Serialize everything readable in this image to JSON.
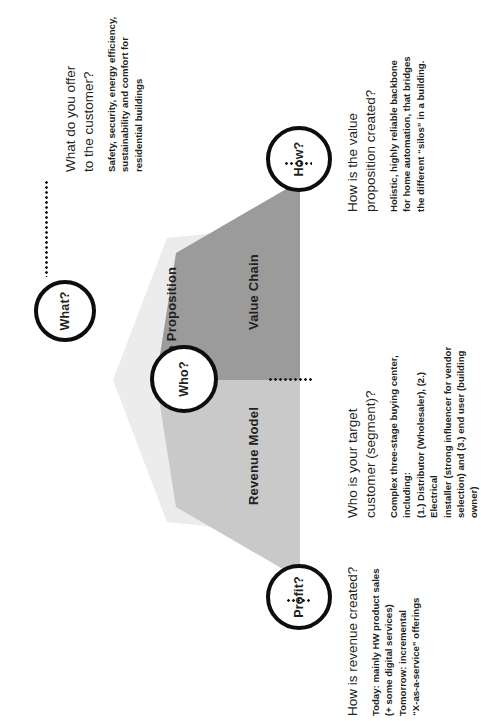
{
  "diagram": {
    "orientation": "rotated-90-ccw",
    "colors": {
      "value_proposition": "#ececec",
      "value_chain": "#9b9b9b",
      "revenue_model": "#c9c9c9",
      "node_border": "#0d0d0d",
      "node_fill": "#ffffff",
      "text": "#231f20"
    },
    "wedges": [
      {
        "id": "value-proposition",
        "label": "Value Proposition",
        "color": "#ececec"
      },
      {
        "id": "value-chain",
        "label": "Value Chain",
        "color": "#9b9b9b"
      },
      {
        "id": "revenue-model",
        "label": "Revenue Model",
        "color": "#c9c9c9"
      }
    ],
    "nodes": [
      {
        "id": "what",
        "label": "What?"
      },
      {
        "id": "who",
        "label": "Who?"
      },
      {
        "id": "how",
        "label": "How?"
      },
      {
        "id": "profit",
        "label": "Profit?"
      }
    ]
  },
  "notes": {
    "what": {
      "question": "What do you offer\nto the customer?",
      "answer": "Safety, security, energy efficiency,\nsustainability and comfort for\nresidential buildings"
    },
    "how": {
      "question": "How is the value\nproposition created?",
      "answer": "Holistic, highly reliable backbone\nfor home automation, that bridges\nthe different “silos” in a building."
    },
    "who": {
      "question": "Who is your target\ncustomer (segment)?",
      "answer": "Complex three-stage buying center, including:\n(1.) Distributor (Wholesaler), (2.) Electrical\ninstaller (strong influencer for vendor\nselection) and (3.) end user (building owner)"
    },
    "profit": {
      "question": "How is revenue created?",
      "answer": "Today: mainly HW product sales\n(+ some digital services)\nTomorrow: incremental\n“X-as-a-service” offerings"
    }
  }
}
